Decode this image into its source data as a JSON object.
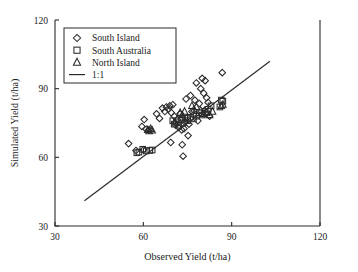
{
  "chart_data": {
    "type": "scatter",
    "title": "",
    "xlabel": "Observed Yield (t/ha)",
    "ylabel": "Simulated Yield (t/ha)",
    "xlim": [
      30,
      120
    ],
    "ylim": [
      30,
      120
    ],
    "xticks": [
      30,
      60,
      90,
      120
    ],
    "yticks": [
      30,
      60,
      90,
      120
    ],
    "xtick_labels": [
      "30",
      "60",
      "90",
      "120"
    ],
    "ytick_labels": [
      "30",
      "60",
      "90",
      "120"
    ],
    "grid": false,
    "legend_position": "upper-left",
    "series": [
      {
        "name": "South Island",
        "marker": "diamond",
        "points": [
          [
            55.0,
            66.0
          ],
          [
            57.5,
            63.0
          ],
          [
            59.5,
            73.5
          ],
          [
            60.3,
            76.5
          ],
          [
            60.0,
            63.3
          ],
          [
            61.0,
            72.3
          ],
          [
            62.0,
            72.0
          ],
          [
            64.5,
            79.0
          ],
          [
            65.5,
            77.0
          ],
          [
            66.5,
            81.5
          ],
          [
            67.3,
            80.0
          ],
          [
            67.8,
            82.0
          ],
          [
            68.5,
            81.0
          ],
          [
            69.0,
            82.5
          ],
          [
            69.5,
            79.5
          ],
          [
            69.3,
            66.5
          ],
          [
            70.0,
            83.0
          ],
          [
            70.5,
            78.0
          ],
          [
            70.8,
            75.0
          ],
          [
            71.0,
            74.0
          ],
          [
            71.5,
            76.5
          ],
          [
            72.0,
            73.0
          ],
          [
            72.5,
            79.0
          ],
          [
            73.0,
            72.0
          ],
          [
            73.2,
            65.5
          ],
          [
            73.5,
            60.5
          ],
          [
            74.0,
            75.5
          ],
          [
            74.5,
            85.5
          ],
          [
            75.0,
            77.5
          ],
          [
            75.5,
            74.5
          ],
          [
            76.0,
            87.0
          ],
          [
            76.5,
            80.0
          ],
          [
            77.0,
            78.5
          ],
          [
            77.5,
            85.0
          ],
          [
            78.0,
            92.5
          ],
          [
            78.5,
            76.0
          ],
          [
            79.0,
            83.5
          ],
          [
            79.5,
            90.0
          ],
          [
            80.0,
            94.5
          ],
          [
            80.5,
            88.0
          ],
          [
            80.8,
            80.5
          ],
          [
            81.0,
            93.5
          ],
          [
            81.5,
            86.0
          ],
          [
            82.0,
            84.0
          ],
          [
            82.5,
            78.0
          ],
          [
            73.8,
            72.5
          ],
          [
            75.2,
            69.5
          ],
          [
            86.8,
            97.0
          ]
        ]
      },
      {
        "name": "South Australia",
        "marker": "square",
        "points": [
          [
            57.8,
            62.0
          ],
          [
            58.5,
            62.3
          ],
          [
            59.8,
            63.5
          ],
          [
            61.0,
            62.8
          ],
          [
            62.2,
            63.0
          ],
          [
            63.0,
            63.2
          ],
          [
            70.0,
            76.0
          ],
          [
            70.5,
            74.5
          ],
          [
            71.2,
            75.5
          ],
          [
            72.0,
            74.0
          ],
          [
            72.8,
            76.5
          ],
          [
            73.5,
            75.0
          ],
          [
            74.2,
            77.0
          ],
          [
            75.0,
            76.0
          ],
          [
            76.0,
            77.5
          ],
          [
            77.0,
            76.8
          ],
          [
            78.0,
            78.0
          ],
          [
            79.0,
            79.5
          ],
          [
            80.0,
            78.5
          ],
          [
            81.0,
            80.0
          ],
          [
            82.0,
            81.0
          ],
          [
            83.0,
            82.5
          ],
          [
            86.5,
            85.0
          ],
          [
            87.0,
            84.5
          ],
          [
            86.0,
            82.0
          ]
        ]
      },
      {
        "name": "North Island",
        "marker": "triangle",
        "points": [
          [
            61.5,
            72.0
          ],
          [
            62.0,
            71.5
          ],
          [
            62.5,
            72.5
          ],
          [
            63.0,
            71.8
          ],
          [
            72.5,
            79.5
          ],
          [
            73.2,
            78.5
          ],
          [
            74.0,
            80.0
          ],
          [
            76.5,
            82.5
          ],
          [
            77.2,
            81.0
          ],
          [
            78.0,
            82.0
          ],
          [
            79.5,
            80.5
          ],
          [
            80.5,
            79.0
          ],
          [
            81.5,
            79.5
          ],
          [
            82.5,
            78.5
          ],
          [
            83.5,
            80.0
          ],
          [
            86.5,
            82.5
          ],
          [
            87.0,
            83.0
          ]
        ]
      }
    ],
    "reference_line": {
      "name": "1:1",
      "from": [
        40,
        41
      ],
      "to": [
        103,
        102
      ]
    },
    "legend": [
      {
        "label": "South Island",
        "marker": "diamond"
      },
      {
        "label": "South Australia",
        "marker": "square"
      },
      {
        "label": "North Island",
        "marker": "triangle"
      },
      {
        "label": "1:1",
        "marker": "line"
      }
    ]
  }
}
